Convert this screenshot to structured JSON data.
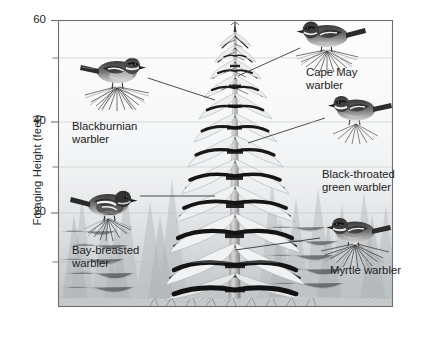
{
  "figure": {
    "kind": "annotated-diagram-over-plot",
    "axis": {
      "title": "Foraging Height (feet)",
      "major_ticks": [
        {
          "value": "60",
          "y": 20
        },
        {
          "value": "40",
          "y": 122
        },
        {
          "value": "20",
          "y": 213
        }
      ],
      "minor_ticks": [
        {
          "y": 58
        },
        {
          "y": 167
        },
        {
          "y": 262
        }
      ],
      "plot_box": {
        "left": 58,
        "top": 20,
        "right": 393,
        "bottom": 307
      },
      "ylim": [
        0,
        60
      ],
      "grid": "faint horizontal at each tick"
    },
    "labels": [
      {
        "name": "blackburnian",
        "lines": [
          "Blackburnian",
          "warbler"
        ],
        "x": 72,
        "y": 120,
        "align": "left"
      },
      {
        "name": "bay-breasted",
        "lines": [
          "Bay-breasted",
          "warbler"
        ],
        "x": 72,
        "y": 244,
        "align": "left"
      },
      {
        "name": "cape-may",
        "lines": [
          "Cape May",
          "warbler"
        ],
        "x": 306,
        "y": 66,
        "align": "left"
      },
      {
        "name": "black-throated-green",
        "lines": [
          "Black-throated",
          "green warbler"
        ],
        "x": 322,
        "y": 168,
        "align": "left"
      },
      {
        "name": "myrtle",
        "lines": [
          "Myrtle warbler"
        ],
        "x": 330,
        "y": 264,
        "align": "left"
      }
    ],
    "birds": [
      {
        "name": "blackburnian-warbler",
        "cx": 117,
        "cy": 72,
        "flip": false
      },
      {
        "name": "cape-may-warbler",
        "cx": 327,
        "cy": 36,
        "flip": true
      },
      {
        "name": "black-throated-green-warbler",
        "cx": 356,
        "cy": 110,
        "flip": true
      },
      {
        "name": "bay-breasted-warbler",
        "cx": 108,
        "cy": 205,
        "flip": false
      },
      {
        "name": "myrtle-warbler",
        "cx": 355,
        "cy": 232,
        "flip": true
      }
    ],
    "leader_lines": [
      {
        "from": "blackburnian-warbler",
        "x1": 148,
        "y1": 78,
        "x2": 215,
        "y2": 100
      },
      {
        "from": "cape-may-warbler",
        "x1": 300,
        "y1": 48,
        "x2": 238,
        "y2": 76
      },
      {
        "from": "black-throated-green-warbler",
        "x1": 325,
        "y1": 118,
        "x2": 248,
        "y2": 143
      },
      {
        "from": "bay-breasted-warbler",
        "x1": 140,
        "y1": 196,
        "x2": 215,
        "y2": 196
      },
      {
        "from": "myrtle-warbler",
        "x1": 320,
        "y1": 238,
        "x2": 235,
        "y2": 250
      }
    ],
    "colors": {
      "axis_line": "#6d6e71",
      "grid_line": "#d4d8da",
      "text": "#231f20",
      "plot_top": "#fdfdfd",
      "plot_bottom": "#dfe2e4",
      "bird_dark": "#2b2b2b",
      "bird_mid": "#6b6b6b",
      "bird_light": "#c9c9c9",
      "tree_dark": "#1f1f1f",
      "tree_mid": "#8d9093",
      "tree_light": "#eef0f1",
      "needle": "#4a4a4a"
    }
  }
}
